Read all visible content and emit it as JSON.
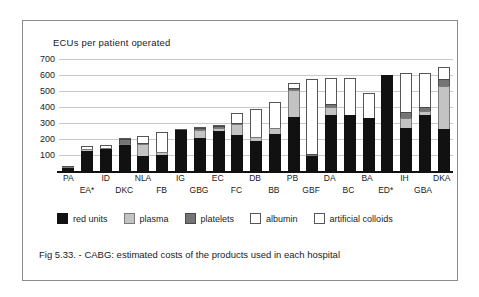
{
  "chart_data": {
    "type": "bar",
    "stacked": true,
    "title": "ECUs per  patient operated",
    "xlabel": "",
    "ylabel": "ECUs per patient operated",
    "ylim": [
      0,
      700
    ],
    "yticks": [
      700,
      600,
      500,
      400,
      300,
      200,
      100
    ],
    "grid": true,
    "legend_position": "bottom",
    "categories": [
      "PA",
      "EA*",
      "ID",
      "DKC",
      "NLA",
      "FB",
      "IG",
      "GBG",
      "EC",
      "FC",
      "DB",
      "BB",
      "PB",
      "GBF",
      "DA",
      "BC",
      "BA",
      "ED*",
      "IH",
      "GBA",
      "DKA"
    ],
    "series": [
      {
        "name": "red units",
        "color": "#111111",
        "values": [
          18,
          125,
          135,
          160,
          95,
          100,
          258,
          208,
          252,
          225,
          185,
          232,
          335,
          95,
          352,
          350,
          333,
          600,
          268,
          348,
          260
        ]
      },
      {
        "name": "plasma",
        "color": "#c3c3c3",
        "values": [
          3,
          12,
          10,
          8,
          75,
          18,
          0,
          50,
          20,
          70,
          25,
          40,
          170,
          0,
          48,
          0,
          0,
          0,
          62,
          30,
          272
        ]
      },
      {
        "name": "platelets",
        "color": "#757575",
        "values": [
          0,
          0,
          0,
          30,
          8,
          0,
          0,
          10,
          10,
          8,
          0,
          0,
          15,
          12,
          18,
          0,
          0,
          0,
          38,
          25,
          42
        ]
      },
      {
        "name": "albumin",
        "color": "#ffffff",
        "values": [
          2,
          18,
          20,
          8,
          40,
          128,
          5,
          10,
          5,
          60,
          178,
          160,
          30,
          468,
          165,
          230,
          152,
          0,
          245,
          212,
          76
        ]
      },
      {
        "name": "artificial colloids",
        "color": "#ffffff",
        "values": [
          0,
          0,
          0,
          0,
          0,
          0,
          0,
          0,
          0,
          0,
          0,
          0,
          0,
          0,
          0,
          0,
          0,
          0,
          0,
          0,
          0
        ]
      }
    ]
  },
  "legend": {
    "items": [
      {
        "label": "red units",
        "key": "red"
      },
      {
        "label": "plasma",
        "key": "plasma"
      },
      {
        "label": "platelets",
        "key": "platelets"
      },
      {
        "label": "albumin",
        "key": "albumin"
      },
      {
        "label": "artificial colloids",
        "key": "colloids"
      }
    ]
  },
  "caption": {
    "text": "Fig 5.33. - CABG: estimated costs of the products used in each hospital"
  }
}
